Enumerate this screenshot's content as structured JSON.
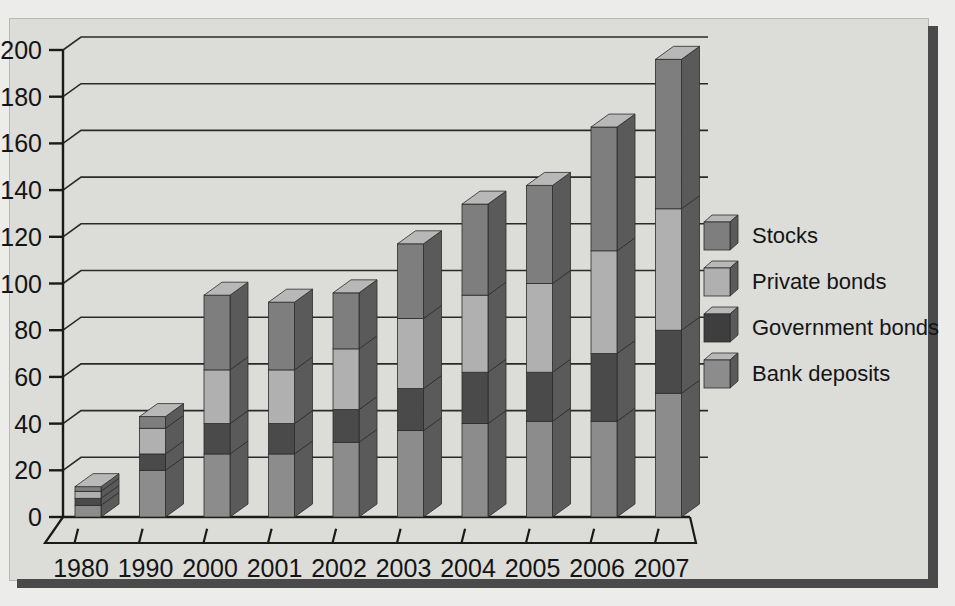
{
  "chart_data": {
    "type": "bar",
    "subtype": "stacked-3d-column",
    "title": "",
    "xlabel": "",
    "ylabel": "",
    "ylim": [
      0,
      200
    ],
    "ytick_step": 20,
    "yticks": [
      0,
      20,
      40,
      60,
      80,
      100,
      120,
      140,
      160,
      180,
      200
    ],
    "grid": true,
    "grid_axis": "y",
    "legend_position": "right",
    "categories": [
      "1980",
      "1990",
      "2000",
      "2001",
      "2002",
      "2003",
      "2004",
      "2005",
      "2006",
      "2007"
    ],
    "series": [
      {
        "name": "Bank deposits",
        "color": "#8c8c8c",
        "values": [
          5,
          20,
          27,
          27,
          32,
          37,
          40,
          41,
          41,
          53
        ]
      },
      {
        "name": "Government bonds",
        "color": "#4a4a4a",
        "values": [
          3,
          7,
          13,
          13,
          14,
          18,
          22,
          21,
          29,
          27
        ]
      },
      {
        "name": "Private bonds",
        "color": "#b0b0b0",
        "values": [
          3,
          11,
          23,
          23,
          26,
          30,
          33,
          38,
          44,
          52
        ]
      },
      {
        "name": "Stocks",
        "color": "#7e7e7e",
        "values": [
          2,
          5,
          32,
          29,
          24,
          32,
          39,
          42,
          53,
          64
        ]
      }
    ],
    "totals": [
      13,
      43,
      95,
      92,
      96,
      117,
      134,
      142,
      167,
      196
    ],
    "legend_entries": [
      {
        "label": "Stocks",
        "color": "#7e7e7e"
      },
      {
        "label": "Private bonds",
        "color": "#b0b0b0"
      },
      {
        "label": "Government bonds",
        "color": "#3e3e3e"
      },
      {
        "label": "Bank deposits",
        "color": "#8c8c8c"
      }
    ]
  },
  "colors": {
    "panel_background": "#dcdcd8",
    "page_background": "#ececea",
    "axis": "#1a1a1a",
    "gridline": "#2a2a2a",
    "shadow": "#4a4a4a",
    "bar_top_face": "#b8b8b8",
    "bar_side_face": "#5a5a5a"
  }
}
